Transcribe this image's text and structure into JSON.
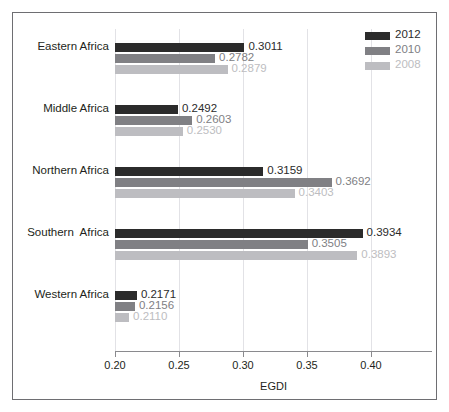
{
  "chart_data": {
    "type": "bar",
    "orientation": "horizontal",
    "title": "",
    "xlabel": "EGDI",
    "ylabel": "",
    "xlim": [
      0.2,
      0.4475
    ],
    "xticks": [
      0.2,
      0.25,
      0.3,
      0.35,
      0.4
    ],
    "xticklabels": [
      "0.20",
      "0.25",
      "0.30",
      "0.35",
      "0.40"
    ],
    "grid": true,
    "legend_position": "top-right",
    "categories": [
      "Eastern Africa",
      "Middle Africa",
      "Northern Africa",
      "Southern  Africa",
      "Western Africa"
    ],
    "series": [
      {
        "name": "2012",
        "color": "#2b2b2b",
        "values": [
          0.3011,
          0.2492,
          0.3159,
          0.3934,
          0.2171
        ],
        "labels": [
          "0.3011",
          "0.2492",
          "0.3159",
          "0.3934",
          "0.2171"
        ]
      },
      {
        "name": "2010",
        "color": "#808084",
        "values": [
          0.2782,
          0.2603,
          0.3692,
          0.3505,
          0.2156
        ],
        "labels": [
          "0.2782",
          "0.2603",
          "0.3692",
          "0.3505",
          "0.2156"
        ]
      },
      {
        "name": "2008",
        "color": "#bdbdc1",
        "values": [
          0.2879,
          0.253,
          0.3403,
          0.3893,
          0.211
        ],
        "labels": [
          "0.2879",
          "0.2530",
          "0.3403",
          "0.3893",
          "0.2110"
        ]
      }
    ]
  },
  "legend": {
    "entries": [
      {
        "label": "2012",
        "color": "#2b2b2b"
      },
      {
        "label": "2010",
        "color": "#808084",
        "x": 0
      },
      {
        "label": "2008",
        "color": "#bdbdc1"
      }
    ]
  },
  "colors": {
    "border": "#6e6e72",
    "gridline": "#e2e2e6",
    "axis": "#8a8a8e",
    "text": "#231f20",
    "background": "#ffffff"
  }
}
